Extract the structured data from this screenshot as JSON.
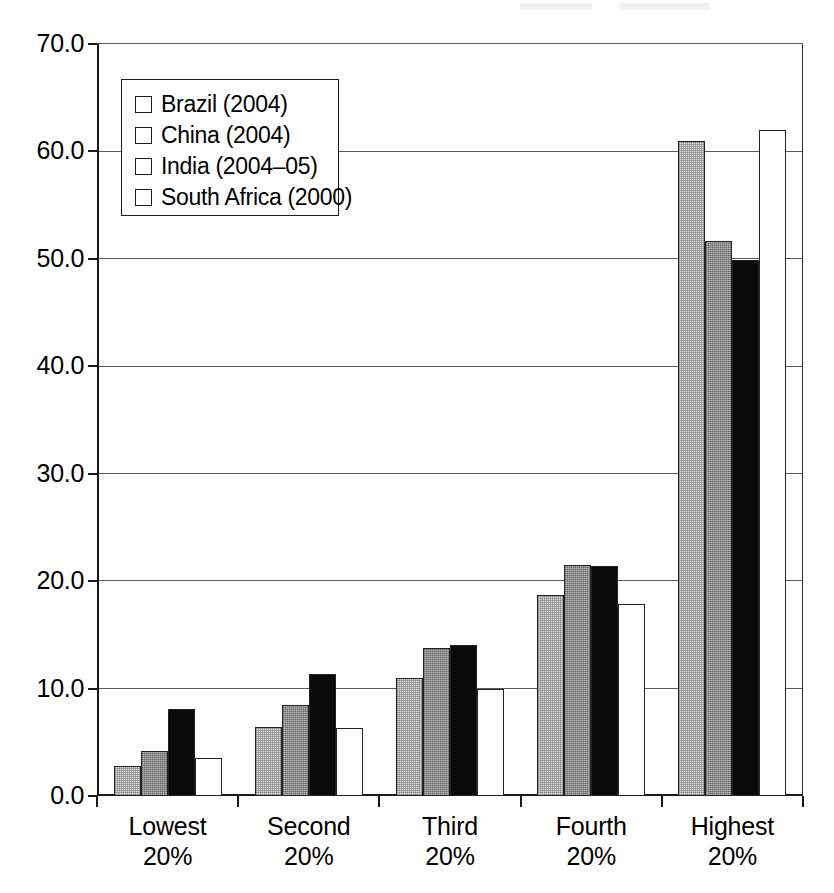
{
  "chart_data": {
    "type": "bar",
    "title": "",
    "subtitle": "",
    "xlabel": "",
    "ylabel": "",
    "categories": [
      "Lowest 20%",
      "Second 20%",
      "Third 20%",
      "Fourth 20%",
      "Highest 20%"
    ],
    "category_lines": [
      [
        "Lowest",
        "20%"
      ],
      [
        "Second",
        "20%"
      ],
      [
        "Third",
        "20%"
      ],
      [
        "Fourth",
        "20%"
      ],
      [
        "Highest",
        "20%"
      ]
    ],
    "series": [
      {
        "name": "Brazil (2004)",
        "color": "#dcdcdc",
        "values": [
          2.8,
          6.4,
          11.0,
          18.7,
          61.0
        ]
      },
      {
        "name": "China (2004)",
        "color": "#8c8c8c",
        "values": [
          4.2,
          8.5,
          13.8,
          21.5,
          51.7
        ]
      },
      {
        "name": "India (2004–05)",
        "color": "#0a0a0a",
        "values": [
          8.1,
          11.4,
          14.1,
          21.4,
          49.9
        ]
      },
      {
        "name": "South Africa (2000)",
        "color": "#ffffff",
        "values": [
          3.5,
          6.3,
          10.0,
          17.9,
          62.0
        ]
      }
    ],
    "ylim": [
      0.0,
      70.0
    ],
    "yticks": [
      0.0,
      10.0,
      20.0,
      30.0,
      40.0,
      50.0,
      60.0,
      70.0
    ],
    "ytick_labels": [
      "0.0",
      "10.0",
      "20.0",
      "30.0",
      "40.0",
      "50.0",
      "60.0",
      "70.0"
    ],
    "grid": true,
    "grid_axis": "y",
    "legend_position": "upper-left"
  },
  "legend": {
    "items": [
      {
        "label": "Brazil (2004)",
        "swatch": "#dcdcdc",
        "style": "s-brazil"
      },
      {
        "label": "China (2004)",
        "swatch": "#8c8c8c",
        "style": "s-china"
      },
      {
        "label": "India (2004–05)",
        "swatch": "#0a0a0a",
        "style": "s-india"
      },
      {
        "label": "South Africa (2000)",
        "swatch": "#ffffff",
        "style": "s-southafrica"
      }
    ]
  },
  "colors": {
    "background": "#ffffff",
    "axis": "#1a1a1a",
    "grid": "#5b5b5b",
    "bar_outline": "#222222"
  }
}
